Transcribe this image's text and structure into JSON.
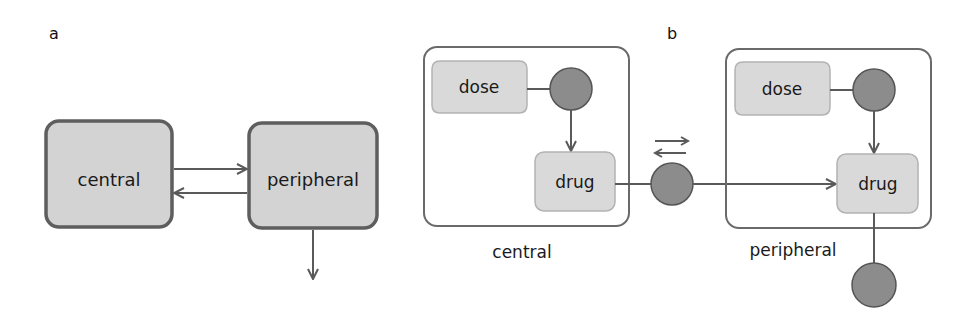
{
  "panels": {
    "a": {
      "label": "a",
      "compartments": [
        {
          "id": "central",
          "label": "central"
        },
        {
          "id": "peripheral",
          "label": "peripheral"
        }
      ],
      "edges": [
        {
          "from": "central",
          "to": "peripheral",
          "type": "transfer"
        },
        {
          "from": "peripheral",
          "to": "central",
          "type": "transfer"
        },
        {
          "from": "peripheral",
          "to": "out",
          "type": "elimination"
        }
      ]
    },
    "b": {
      "label": "b",
      "compartments": [
        {
          "id": "central",
          "label": "central",
          "dose_label": "dose",
          "drug_label": "drug"
        },
        {
          "id": "peripheral",
          "label": "peripheral",
          "dose_label": "dose",
          "drug_label": "drug"
        }
      ],
      "transfer_glyph": "reversible",
      "edges": [
        {
          "from": "central.dose",
          "to": "central.drug",
          "type": "dosing"
        },
        {
          "from": "peripheral.dose",
          "to": "peripheral.drug",
          "type": "dosing"
        },
        {
          "from": "central.drug",
          "to": "peripheral.drug",
          "type": "reversible-transfer"
        },
        {
          "from": "peripheral.drug",
          "to": "sink",
          "type": "elimination"
        }
      ]
    }
  },
  "colors": {
    "box_fill_a": "#d3d3d3",
    "box_stroke_a": "#5e5e5e",
    "node_fill_b": "#d9d9d9",
    "node_stroke_b": "#a9a9a9",
    "process_fill": "#8c8c8c",
    "process_stroke": "#555555",
    "edge": "#5a5a5a",
    "compartment_stroke": "#6a6a6a"
  }
}
